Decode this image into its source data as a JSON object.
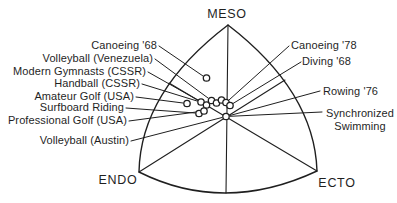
{
  "figure": {
    "type": "somatochart-diagram",
    "axis_labels": {
      "top": "MESO",
      "bottom_left": "ENDO",
      "bottom_right": "ECTO"
    },
    "left_labels": [
      "Canoeing '68",
      "Volleyball (Venezuela)",
      "Modern Gymnasts (CSSR)",
      "Handball (CSSR)",
      "Amateur Golf (USA)",
      "Surfboard Riding",
      "Professional Golf (USA)",
      "Volleyball (Austin)"
    ],
    "right_labels": [
      "Canoeing '78",
      "Diving '68",
      "Rowing '76",
      "Synchronized Swimming"
    ],
    "colors": {
      "ink": "#1f1f1f",
      "background": "#ffffff"
    }
  }
}
